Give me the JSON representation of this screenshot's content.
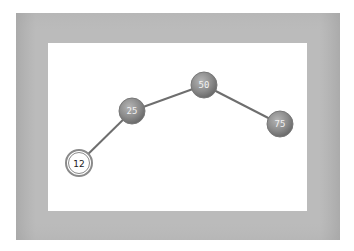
{
  "diagram": {
    "type": "binary-tree",
    "frame_color": "#b9b9b9",
    "canvas_color": "#ffffff",
    "edge_color": "#6e6e6e",
    "nodes": [
      {
        "id": "n50",
        "label": "50",
        "x": 204,
        "y": 85,
        "style": "filled",
        "fill": "#8a8a8a",
        "text_color": "#f2f2f2"
      },
      {
        "id": "n25",
        "label": "25",
        "x": 132,
        "y": 111,
        "style": "filled",
        "fill": "#8a8a8a",
        "text_color": "#f2f2f2"
      },
      {
        "id": "n75",
        "label": "75",
        "x": 280,
        "y": 124,
        "style": "filled",
        "fill": "#8a8a8a",
        "text_color": "#f2f2f2"
      },
      {
        "id": "n12",
        "label": "12",
        "x": 79,
        "y": 163,
        "style": "highlighted",
        "fill": "#ffffff",
        "text_color": "#222222"
      }
    ],
    "edges": [
      {
        "from": "50",
        "to": "25"
      },
      {
        "from": "50",
        "to": "75"
      },
      {
        "from": "25",
        "to": "12"
      }
    ]
  }
}
